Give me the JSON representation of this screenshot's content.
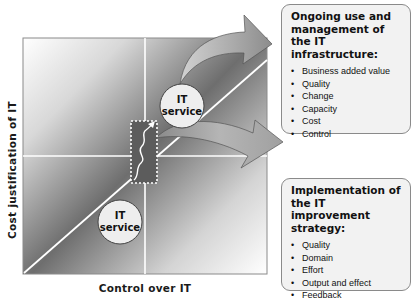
{
  "diagram": {
    "y_axis_label": "Cost justification of IT",
    "x_axis_label": "Control over IT",
    "circles": [
      {
        "label_line1": "IT",
        "label_line2": "service",
        "position": "upper-right"
      },
      {
        "label_line1": "IT",
        "label_line2": "service",
        "position": "lower-left"
      }
    ],
    "panels": [
      {
        "title": "Ongoing use and management of the IT infrastructure:",
        "items": [
          "Business added value",
          "Quality",
          "Change",
          "Capacity",
          "Cost",
          "Control"
        ]
      },
      {
        "title": "Implementation of the IT improvement strategy:",
        "items": [
          "Quality",
          "Domain",
          "Effort",
          "Output and effect",
          "Feedback"
        ]
      }
    ]
  }
}
